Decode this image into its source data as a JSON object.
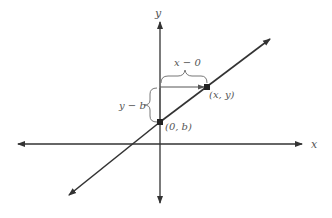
{
  "diagram": {
    "axes": {
      "x_label": "x",
      "y_label": "y"
    },
    "points": {
      "intercept_label": "(0, b)",
      "point_label": "(x, y)"
    },
    "braces": {
      "horizontal_label": "x − 0",
      "vertical_label": "y − b"
    },
    "colors": {
      "line": "#333333",
      "label": "#555555",
      "brace": "#777777"
    }
  }
}
